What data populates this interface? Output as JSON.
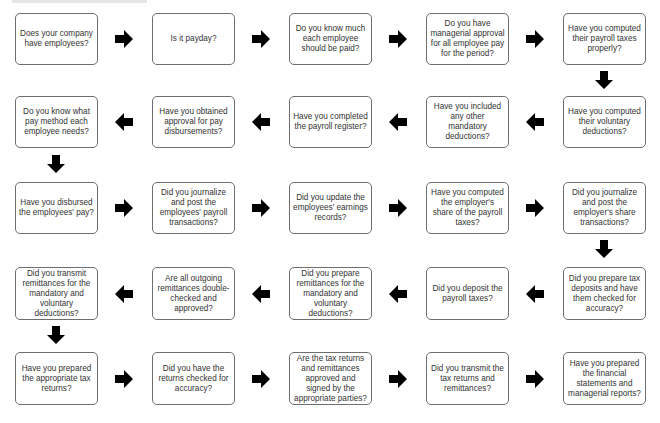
{
  "diagram": {
    "title": "",
    "rows": [
      {
        "direction": "right",
        "steps": [
          "Does your company have employees?",
          "Is it payday?",
          "Do you know much each employee should be paid?",
          "Do you have managerial approval for all employee pay for the period?",
          "Have you computed their payroll taxes properly?"
        ]
      },
      {
        "direction": "left",
        "steps": [
          "Do you know what pay method each employee needs?",
          "Have you obtained approval for pay disbursements?",
          "Have you completed the payroll register?",
          "Have you included any other mandatory deductions?",
          "Have you computed their voluntary deductions?"
        ]
      },
      {
        "direction": "right",
        "steps": [
          "Have you disbursed the employees' pay?",
          "Did you journalize and post the employees' payroll transactions?",
          "Did you update the employees' earnings records?",
          "Have you computed the employer's share of the payroll taxes?",
          "Did you journalize and post the employer's share transactions?"
        ]
      },
      {
        "direction": "left",
        "steps": [
          "Did you transmit remittances for the mandatory and voluntary deductions?",
          "Are all outgoing remittances double-checked and approved?",
          "Did you prepare remittances for the mandatory and voluntary deductions?",
          "Did you deposit the payroll taxes?",
          "Did you prepare tax deposits and have them checked for accuracy?"
        ]
      },
      {
        "direction": "right",
        "steps": [
          "Have you prepared the appropriate tax returns?",
          "Did you have the returns checked for accuracy?",
          "Are the tax returns and remittances approved and signed by the appropriate parties?",
          "Did you transmit the tax returns and remittances?",
          "Have you prepared the financial statements and managerial reports?"
        ]
      }
    ],
    "colors": {
      "box_border": "#6e6e6e",
      "arrow": "#000000",
      "text": "#333333"
    }
  }
}
